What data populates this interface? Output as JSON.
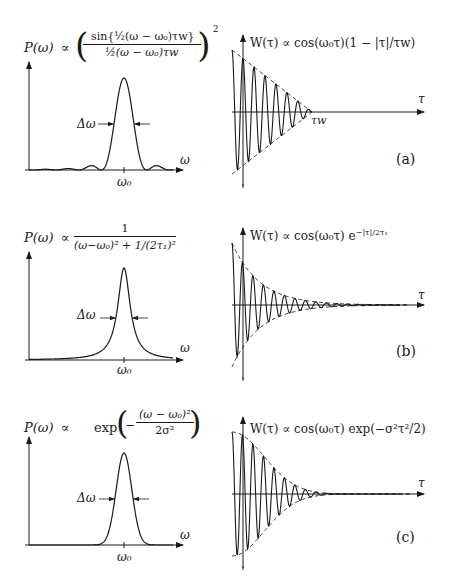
{
  "figure": {
    "panels": [
      {
        "id": "a",
        "tag": "(a)",
        "spectrum": {
          "ylabel": "P(ω)",
          "prop": "∝",
          "formula_numerator": "sin{½(ω − ω₀)τw}",
          "formula_denominator": "½(ω − ω₀)τw",
          "exponent": "2",
          "shape": "sinc-squared",
          "width_label": "Δω",
          "xaxis_label": "ω",
          "center_label": "ω₀"
        },
        "correlation": {
          "label": "W(τ) ∝ cos(ω₀τ)(1 − |τ|/τw)",
          "envelope": "triangular",
          "xaxis_label": "τ",
          "cutoff_label": "τw"
        }
      },
      {
        "id": "b",
        "tag": "(b)",
        "spectrum": {
          "ylabel": "P(ω)",
          "prop": "∝",
          "formula_numerator": "1",
          "formula_denominator": "(ω−ω₀)² + 1/(2τ₁)²",
          "shape": "lorentzian",
          "width_label": "Δω",
          "xaxis_label": "ω",
          "center_label": "ω₀"
        },
        "correlation": {
          "label": "W(τ) ∝ cos(ω₀τ) e^(−|τ|/2τ₁)",
          "label_main": "W(τ) ∝ cos(ω₀τ) e",
          "label_sup": "−|τ|/2τ₁",
          "envelope": "exponential",
          "xaxis_label": "τ"
        }
      },
      {
        "id": "c",
        "tag": "(c)",
        "spectrum": {
          "ylabel": "P(ω)",
          "prop": "∝",
          "formula_prefix": "exp",
          "formula_numerator": "(ω − ω₀)²",
          "formula_denominator": "2σ²",
          "shape": "gaussian",
          "width_label": "Δω",
          "xaxis_label": "ω",
          "center_label": "ω₀"
        },
        "correlation": {
          "label": "W(τ) ∝ cos(ω₀τ) exp(−σ²τ²/2)",
          "envelope": "gaussian",
          "xaxis_label": "τ"
        }
      }
    ]
  },
  "chart_data": [
    {
      "type": "line",
      "title": "P(ω) ∝ (sin{½(ω−ω₀)τw} / ½(ω−ω₀)τw)²",
      "xlabel": "ω",
      "ylabel": "P(ω)",
      "x_ticks": [
        "ω₀"
      ],
      "annotation": "Δω",
      "grid": false,
      "series": [
        {
          "name": "sinc² line shape"
        }
      ]
    },
    {
      "type": "line",
      "title": "W(τ) ∝ cos(ω₀τ)(1 − |τ|/τw)",
      "xlabel": "τ",
      "ylabel": "W(τ)",
      "x_ticks": [
        "τw"
      ],
      "annotation": "(a)",
      "grid": false,
      "series": [
        {
          "name": "oscillation"
        },
        {
          "name": "triangular envelope (dashed)"
        }
      ]
    },
    {
      "type": "line",
      "title": "P(ω) ∝ 1 / ((ω−ω₀)² + 1/(2τ₁)²)",
      "xlabel": "ω",
      "ylabel": "P(ω)",
      "x_ticks": [
        "ω₀"
      ],
      "annotation": "Δω",
      "grid": false,
      "series": [
        {
          "name": "Lorentzian line shape"
        }
      ]
    },
    {
      "type": "line",
      "title": "W(τ) ∝ cos(ω₀τ) e^(−|τ|/2τ₁)",
      "xlabel": "τ",
      "ylabel": "W(τ)",
      "annotation": "(b)",
      "grid": false,
      "series": [
        {
          "name": "oscillation"
        },
        {
          "name": "exponential envelope (dashed)"
        }
      ]
    },
    {
      "type": "line",
      "title": "P(ω) ∝ exp(−(ω−ω₀)²/2σ²)",
      "xlabel": "ω",
      "ylabel": "P(ω)",
      "x_ticks": [
        "ω₀"
      ],
      "annotation": "Δω",
      "grid": false,
      "series": [
        {
          "name": "Gaussian line shape"
        }
      ]
    },
    {
      "type": "line",
      "title": "W(τ) ∝ cos(ω₀τ) exp(−σ²τ²/2)",
      "xlabel": "τ",
      "ylabel": "W(τ)",
      "annotation": "(c)",
      "grid": false,
      "series": [
        {
          "name": "oscillation"
        },
        {
          "name": "Gaussian envelope (dashed)"
        }
      ]
    }
  ]
}
